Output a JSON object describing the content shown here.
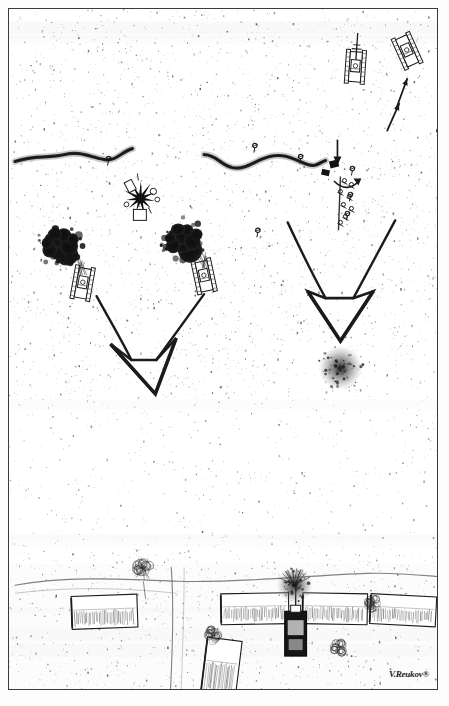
{
  "artwork": {
    "kind": "hand-drawn aerial tactical battle sketch",
    "signature": "V.Reukov®",
    "width": 449,
    "height": 706,
    "frame_color": "#3a3a3a",
    "ink_color": "#1b1b1b",
    "paper_color": "#ffffff",
    "smoke_color": "#121212"
  },
  "chart_data": {
    "type": "diagram",
    "title": "",
    "map_features": [
      {
        "name": "trench-left",
        "label": "defensive trench line (left)",
        "kind": "trench",
        "path": "M 6,153 C 26,146 40,150 56,146 C 72,142 82,149 96,151 C 108,153 113,143 124,140",
        "stroke": "#2a2a2a",
        "width": 3.2
      },
      {
        "name": "trench-right",
        "label": "defensive trench line (right)",
        "kind": "trench",
        "path": "M 196,146 C 208,146 212,156 224,159 C 238,162 246,152 262,148 C 278,144 288,152 300,156 C 308,159 312,154 318,152",
        "stroke": "#2a2a2a",
        "width": 3.2
      }
    ],
    "burning_vehicles": [
      {
        "name": "burning-tank-left",
        "x": 74,
        "y": 275,
        "rotation": 10,
        "smoke_dx": -16,
        "smoke_dy": -28
      },
      {
        "name": "burning-tank-right",
        "x": 196,
        "y": 268,
        "rotation": -12,
        "smoke_dx": -14,
        "smoke_dy": -26
      }
    ],
    "advancing_vehicles": [
      {
        "name": "advancing-tank-top",
        "x": 348,
        "y": 58,
        "rotation": 4,
        "has_gun": true
      },
      {
        "name": "advancing-truck-top",
        "x": 400,
        "y": 42,
        "rotation": -24,
        "has_gun": false
      }
    ],
    "movement_arrows": [
      {
        "name": "small-arrow-lower",
        "x1": 380,
        "y1": 122,
        "x2": 392,
        "y2": 95
      },
      {
        "name": "small-arrow-upper",
        "x1": 389,
        "y1": 100,
        "x2": 400,
        "y2": 70
      }
    ],
    "attack_arrows": [
      {
        "name": "attack-arrow-left",
        "label": "converging assault arrow (left group)",
        "left_stroke": "M 88,288 C 100,310 112,330 123,352",
        "right_stroke": "M 196,286 C 180,308 164,330 148,352",
        "head": "102,336 147,386 168,330 148,352 123,352"
      },
      {
        "name": "attack-arrow-right",
        "label": "converging assault arrow (right group)",
        "left_stroke": "M 280,214 C 294,244 306,268 318,290",
        "right_stroke": "M 388,212 C 372,242 358,268 346,290",
        "head": "300,283 333,333 366,283 346,290 318,290"
      }
    ],
    "explosions": [
      {
        "name": "explosion-burst-center",
        "x": 132,
        "y": 190,
        "radius": 14,
        "kind": "star-burst"
      },
      {
        "name": "shell-crater-right",
        "x": 333,
        "y": 360,
        "radius": 11,
        "kind": "smudge-crater"
      },
      {
        "name": "explosion-village",
        "x": 287,
        "y": 578,
        "radius": 9,
        "kind": "smudge-burst"
      }
    ],
    "infantry_markers": [
      {
        "name": "soldier-marker-1",
        "x": 100,
        "y": 150
      },
      {
        "name": "soldier-marker-2",
        "x": 247,
        "y": 137
      },
      {
        "name": "soldier-marker-3",
        "x": 250,
        "y": 222
      },
      {
        "name": "soldier-marker-4",
        "x": 293,
        "y": 148
      },
      {
        "name": "soldier-marker-5",
        "x": 345,
        "y": 160
      },
      {
        "name": "soldier-marker-6",
        "x": 343,
        "y": 186
      },
      {
        "name": "soldier-marker-7",
        "x": 340,
        "y": 205
      },
      {
        "name": "soldier-marker-8",
        "x": 432,
        "y": 122
      },
      {
        "name": "soldier-marker-9",
        "x": 46,
        "y": 232
      }
    ],
    "village": {
      "name": "village-bottom",
      "label": "village with road junction",
      "roads": [
        {
          "name": "road-horizontal",
          "path": "M 6,578 C 60,568 120,572 170,574 C 230,576 300,568 360,566 C 390,565 415,568 440,570"
        },
        {
          "name": "road-vertical",
          "path": "M 163,560 C 166,600 164,650 162,688"
        }
      ],
      "buildings": [
        {
          "name": "building-1",
          "x": 63,
          "y": 588,
          "w": 66,
          "h": 33,
          "rotation": -2
        },
        {
          "name": "building-2",
          "x": 213,
          "y": 586,
          "w": 68,
          "h": 31,
          "rotation": -1
        },
        {
          "name": "building-3",
          "x": 295,
          "y": 586,
          "w": 65,
          "h": 31,
          "rotation": 1
        },
        {
          "name": "building-4",
          "x": 363,
          "y": 588,
          "w": 66,
          "h": 30,
          "rotation": 3
        },
        {
          "name": "building-5",
          "x": 196,
          "y": 632,
          "w": 35,
          "h": 55,
          "rotation": 7
        }
      ],
      "trees": [
        {
          "name": "tree-large",
          "x": 135,
          "y": 561,
          "r": 13
        },
        {
          "name": "tree-bush-1",
          "x": 205,
          "y": 628,
          "r": 11
        },
        {
          "name": "tree-bush-2",
          "x": 331,
          "y": 641,
          "r": 11
        },
        {
          "name": "tree-bush-3",
          "x": 366,
          "y": 597,
          "r": 11
        }
      ],
      "vehicle": {
        "name": "village-tank",
        "x": 277,
        "y": 604,
        "w": 22,
        "h": 45
      }
    },
    "speckle_density": "heavy scanned-grain texture across the whole field"
  }
}
